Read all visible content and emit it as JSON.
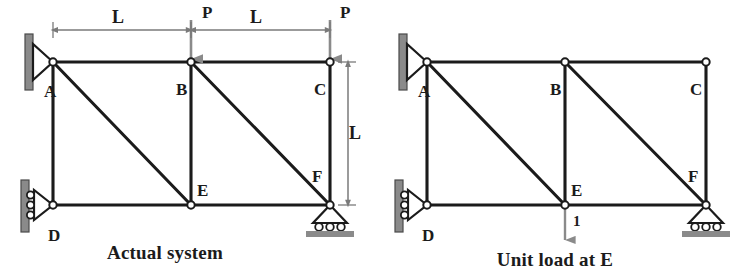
{
  "figure": {
    "kind": "structural-truss-diagram",
    "panel_count": 2
  },
  "colors": {
    "member": "#1b1b1b",
    "joint_fill": "#ffffff",
    "joint_stroke": "#1b1b1b",
    "support_wall": "#8a8a8a",
    "support_wall_edge": "#4a4a4a",
    "ground_bar": "#8a8a8a",
    "load_arrow": "#8a8a8a",
    "dimension_line": "#7a7a7a",
    "text": "#1b1b1b",
    "background": "#ffffff"
  },
  "panels": [
    {
      "id": "actual-system",
      "caption": "Actual system",
      "joints": [
        {
          "name": "A",
          "label": "A",
          "x": 53,
          "y": 62,
          "label_x": 44,
          "label_y": 97
        },
        {
          "name": "B",
          "label": "B",
          "x": 191,
          "y": 62,
          "label_x": 176,
          "label_y": 95
        },
        {
          "name": "C",
          "label": "C",
          "x": 330,
          "y": 62,
          "label_x": 314,
          "label_y": 95
        },
        {
          "name": "D",
          "label": "D",
          "x": 53,
          "y": 205,
          "label_x": 48,
          "label_y": 241
        },
        {
          "name": "E",
          "label": "E",
          "x": 191,
          "y": 205,
          "label_x": 197,
          "label_y": 196
        },
        {
          "name": "F",
          "label": "F",
          "x": 330,
          "y": 205,
          "label_x": 312,
          "label_y": 182
        }
      ],
      "members": [
        {
          "name": "A-B",
          "from": "A",
          "to": "B"
        },
        {
          "name": "B-C",
          "from": "B",
          "to": "C"
        },
        {
          "name": "D-E",
          "from": "D",
          "to": "E"
        },
        {
          "name": "E-F",
          "from": "E",
          "to": "F"
        },
        {
          "name": "A-D",
          "from": "A",
          "to": "D"
        },
        {
          "name": "B-E",
          "from": "B",
          "to": "E"
        },
        {
          "name": "C-F",
          "from": "C",
          "to": "F"
        },
        {
          "name": "A-E",
          "from": "A",
          "to": "E"
        },
        {
          "name": "B-F",
          "from": "B",
          "to": "F"
        }
      ],
      "supports": [
        {
          "name": "pin-support-A",
          "type": "pin-wall-left",
          "at": "A"
        },
        {
          "name": "roller-support-D",
          "type": "roller-wall-left",
          "at": "D"
        },
        {
          "name": "roller-support-F",
          "type": "roller-ground",
          "at": "F"
        }
      ],
      "loads": [
        {
          "name": "load-P-at-B",
          "label": "P",
          "at": "B",
          "direction": "down",
          "label_x": 202,
          "label_y": 18
        },
        {
          "name": "load-P-at-C",
          "label": "P",
          "at": "C",
          "direction": "down",
          "label_x": 340,
          "label_y": 18
        }
      ],
      "dimensions": [
        {
          "name": "span-A-to-B",
          "label": "L",
          "orientation": "horizontal",
          "x1": 53,
          "x2": 191,
          "y": 30,
          "label_x": 118,
          "label_y": 23
        },
        {
          "name": "span-B-to-C",
          "label": "L",
          "orientation": "horizontal",
          "x1": 191,
          "x2": 330,
          "y": 30,
          "label_x": 256,
          "label_y": 23
        },
        {
          "name": "height-C-to-F",
          "label": "L",
          "orientation": "vertical",
          "x": 348,
          "y1": 62,
          "y2": 205,
          "label_x": 355,
          "label_y": 139
        }
      ],
      "caption_x": 165,
      "caption_y": 259
    },
    {
      "id": "unit-load-at-E",
      "caption": "Unit load at E",
      "joints": [
        {
          "name": "A",
          "label": "A",
          "x": 427,
          "y": 62,
          "label_x": 418,
          "label_y": 97
        },
        {
          "name": "B",
          "label": "B",
          "x": 565,
          "y": 62,
          "label_x": 550,
          "label_y": 95
        },
        {
          "name": "C",
          "label": "C",
          "x": 706,
          "y": 62,
          "label_x": 690,
          "label_y": 95
        },
        {
          "name": "D",
          "label": "D",
          "x": 427,
          "y": 205,
          "label_x": 422,
          "label_y": 241
        },
        {
          "name": "E",
          "label": "E",
          "x": 565,
          "y": 205,
          "label_x": 571,
          "label_y": 196
        },
        {
          "name": "F",
          "label": "F",
          "x": 706,
          "y": 205,
          "label_x": 688,
          "label_y": 182
        }
      ],
      "members": [
        {
          "name": "A-B",
          "from": "A",
          "to": "B"
        },
        {
          "name": "B-C",
          "from": "B",
          "to": "C"
        },
        {
          "name": "D-E",
          "from": "D",
          "to": "E"
        },
        {
          "name": "E-F",
          "from": "E",
          "to": "F"
        },
        {
          "name": "A-D",
          "from": "A",
          "to": "D"
        },
        {
          "name": "B-E",
          "from": "B",
          "to": "E"
        },
        {
          "name": "C-F",
          "from": "C",
          "to": "F"
        },
        {
          "name": "A-E",
          "from": "A",
          "to": "E"
        },
        {
          "name": "B-F",
          "from": "B",
          "to": "F"
        }
      ],
      "supports": [
        {
          "name": "pin-support-A",
          "type": "pin-wall-left",
          "at": "A"
        },
        {
          "name": "roller-support-D",
          "type": "roller-wall-left",
          "at": "D"
        },
        {
          "name": "roller-support-F",
          "type": "roller-ground",
          "at": "F"
        }
      ],
      "loads": [
        {
          "name": "unit-load-at-E",
          "label": "1",
          "at": "E",
          "direction": "down-from-joint",
          "label_x": 573,
          "label_y": 226
        }
      ],
      "dimensions": [],
      "caption_x": 555,
      "caption_y": 266
    }
  ]
}
